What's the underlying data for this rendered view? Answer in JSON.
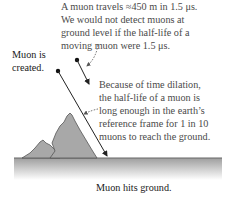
{
  "annotations": {
    "top_note": [
      "A muon travels ≈450 m in 1.5 μs.",
      "We would not detect muons at",
      "ground level if the half-life of a",
      "moving muon were 1.5 μs."
    ],
    "dilation_note": [
      "Because of time dilation,",
      "the half-life of a muon is",
      "long enough in the earth’s",
      "reference frame for 1 in 10",
      "muons to reach the ground."
    ],
    "created_label": [
      "Muon is",
      "created."
    ],
    "ground_label": "Muon hits ground."
  },
  "colors": {
    "ground_line": "#666666",
    "ground_shade": "#bdbdbd",
    "mountain_fill": "#a8a8a8",
    "mountain_stroke": "#555555",
    "trajectory": "#222222",
    "dashed_arrow": "#555555"
  }
}
